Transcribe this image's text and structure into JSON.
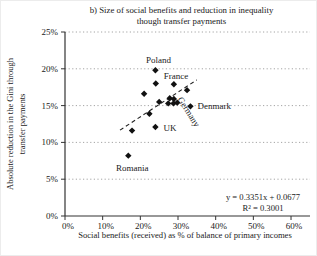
{
  "figure": {
    "title_line1": "b) Size of social benefits and reduction in inequality",
    "title_line2": "though transfer payments",
    "y_axis_label_line1": "Absolute reduction in the Gini through",
    "y_axis_label_line2": "transfer payments",
    "x_axis_label": "Social benefits (received) as % of balance of primary incomes",
    "equation_text": "y = 0.3351x + 0.0677",
    "r_squared_text": "R² = 0.3001"
  },
  "chart_data": {
    "type": "scatter",
    "title": "b) Size of social benefits and reduction in inequality though transfer payments",
    "xlabel": "Social benefits (received) as % of balance of primary incomes",
    "ylabel": "Absolute reduction in the Gini through transfer payments",
    "x_ticks": [
      "0%",
      "10%",
      "20%",
      "30%",
      "40%",
      "50%",
      "60%"
    ],
    "y_ticks": [
      "0%",
      "5%",
      "10%",
      "15%",
      "20%",
      "25%"
    ],
    "xlim_pct": [
      0,
      65
    ],
    "ylim_pct": [
      0,
      25
    ],
    "grid": "horizontal-dotted",
    "marker": "diamond",
    "marker_color": "#111111",
    "grid_color": "#9a9a9a",
    "axis_color": "#333333",
    "points": [
      {
        "x": 24.0,
        "y": 19.8,
        "label": "Poland"
      },
      {
        "x": 24.1,
        "y": 18.0
      },
      {
        "x": 28.9,
        "y": 17.9,
        "label": "France"
      },
      {
        "x": 32.4,
        "y": 17.1
      },
      {
        "x": 21.0,
        "y": 16.6
      },
      {
        "x": 25.0,
        "y": 15.5
      },
      {
        "x": 27.8,
        "y": 16.0
      },
      {
        "x": 28.9,
        "y": 15.9
      },
      {
        "x": 27.4,
        "y": 15.3,
        "label": "Germany"
      },
      {
        "x": 28.8,
        "y": 15.3
      },
      {
        "x": 29.8,
        "y": 15.4
      },
      {
        "x": 33.3,
        "y": 14.9,
        "label": "Denmark"
      },
      {
        "x": 22.4,
        "y": 13.9
      },
      {
        "x": 24.0,
        "y": 12.1,
        "label": "UK"
      },
      {
        "x": 17.8,
        "y": 11.6
      },
      {
        "x": 16.8,
        "y": 8.2,
        "label": "Romania"
      }
    ],
    "trendline": {
      "style": "dashed",
      "slope": 0.3351,
      "intercept": 0.0677,
      "x_range_pct": [
        14.6,
        35.0
      ],
      "equation": "y = 0.3351x + 0.0677",
      "r_squared": "R² = 0.3001"
    }
  }
}
